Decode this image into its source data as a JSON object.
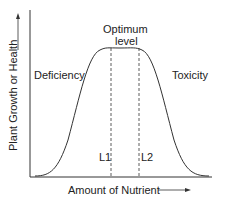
{
  "diagram": {
    "y_axis_label": "Plant Growth or Health",
    "x_axis_label": "Amount of Nutrient",
    "peak_label_line1": "Optimum",
    "peak_label_line2": "level",
    "left_region_label": "Deficiency",
    "right_region_label": "Toxicity",
    "marker_left": "L1",
    "marker_right": "L2",
    "line_color": "#333333"
  }
}
